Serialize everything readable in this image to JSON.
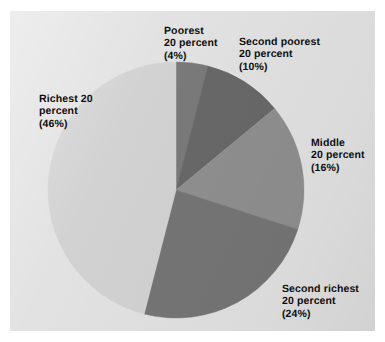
{
  "figure": {
    "background_color": "#ffffff",
    "panel_color": "#e2e2e2",
    "text_color": "#0d0d0d"
  },
  "labels": {
    "poorest": "Poorest\n20 percent\n(4%)",
    "second_poorest": "Second poorest\n20 percent\n(10%)",
    "middle": "Middle\n20 percent\n(16%)",
    "second_richest": "Second richest\n20 percent\n(24%)",
    "richest": "Richest 20\npercent\n(46%)"
  },
  "chart_data": {
    "type": "pie",
    "title": "",
    "subtitle": "",
    "xlabel": "",
    "ylabel": "",
    "legend_position": "none",
    "grid": false,
    "value_unit": "percent",
    "start_angle_deg": -90,
    "direction": "clockwise",
    "categories": [
      "Poorest 20 percent",
      "Second poorest 20 percent",
      "Middle 20 percent",
      "Second richest 20 percent",
      "Richest 20 percent"
    ],
    "values": [
      4,
      10,
      16,
      24,
      46
    ],
    "value_labels": [
      "(4%)",
      "(10%)",
      "(16%)",
      "(24%)",
      "(46%)"
    ],
    "colors": [
      "#7a7a7a",
      "#686868",
      "#8f8f8f",
      "#757575",
      "#d2d2d2"
    ],
    "slices": [
      {
        "name": "Poorest 20 percent",
        "label_line1": "Poorest",
        "label_line2": "20 percent",
        "label_line3": "(4%)",
        "value": 4,
        "color": "#7a7a7a",
        "start_angle_deg": -90,
        "sweep_angle_deg": 14.4
      },
      {
        "name": "Second poorest 20 percent",
        "label_line1": "Second poorest",
        "label_line2": "20 percent",
        "label_line3": "(10%)",
        "value": 10,
        "color": "#686868",
        "start_angle_deg": -75.6,
        "sweep_angle_deg": 36
      },
      {
        "name": "Middle 20 percent",
        "label_line1": "Middle",
        "label_line2": "20 percent",
        "label_line3": "(16%)",
        "value": 16,
        "color": "#8f8f8f",
        "start_angle_deg": -39.6,
        "sweep_angle_deg": 57.6
      },
      {
        "name": "Second richest 20 percent",
        "label_line1": "Second richest",
        "label_line2": "20 percent",
        "label_line3": "(24%)",
        "value": 24,
        "color": "#757575",
        "start_angle_deg": 18,
        "sweep_angle_deg": 86.4
      },
      {
        "name": "Richest 20 percent",
        "label_line1": "Richest 20",
        "label_line2": "percent",
        "label_line3": "(46%)",
        "value": 46,
        "color": "#d2d2d2",
        "start_angle_deg": 104.4,
        "sweep_angle_deg": 165.6
      }
    ],
    "total": 100,
    "geometry": {
      "center_x": 166,
      "center_y": 179,
      "radius": 128
    }
  }
}
